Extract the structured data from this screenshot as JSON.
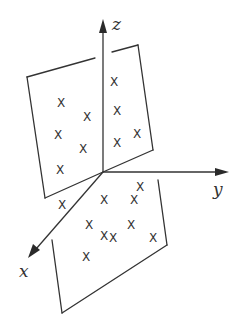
{
  "diagram": {
    "axes": {
      "z": {
        "label": "z"
      },
      "y": {
        "label": "y"
      },
      "x": {
        "label": "x"
      }
    },
    "point_marker": "X",
    "planes": [
      {
        "name": "upper-plane",
        "point_count": 9
      },
      {
        "name": "lower-plane",
        "point_count": 10
      }
    ],
    "colors": {
      "ink": "#333333",
      "background": "#ffffff"
    }
  }
}
